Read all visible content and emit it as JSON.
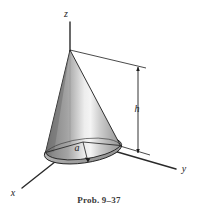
{
  "figure": {
    "caption": "Prob. 9–37",
    "axes": {
      "z_label": "z",
      "y_label": "y",
      "x_label": "x"
    },
    "dimensions": {
      "height_label": "h",
      "radius_label": "a"
    },
    "colors": {
      "background": "#ffffff",
      "line": "#1c1c1c",
      "axis_line": "#2a2a2a",
      "cone_dark": "#7d7d7d",
      "cone_mid": "#9e9e9e",
      "cone_highlight": "#f2f2f2",
      "cone_light": "#b4b4b4",
      "base_fill": "#a9a9a9",
      "base_shadow": "#8c8c8c",
      "caption_text": "#3a3a3a"
    },
    "shape": {
      "type": "cone",
      "apex": [
        70,
        50
      ],
      "base_center": [
        83,
        142
      ],
      "base_left": [
        45,
        157
      ],
      "base_right": [
        122,
        148
      ]
    }
  }
}
